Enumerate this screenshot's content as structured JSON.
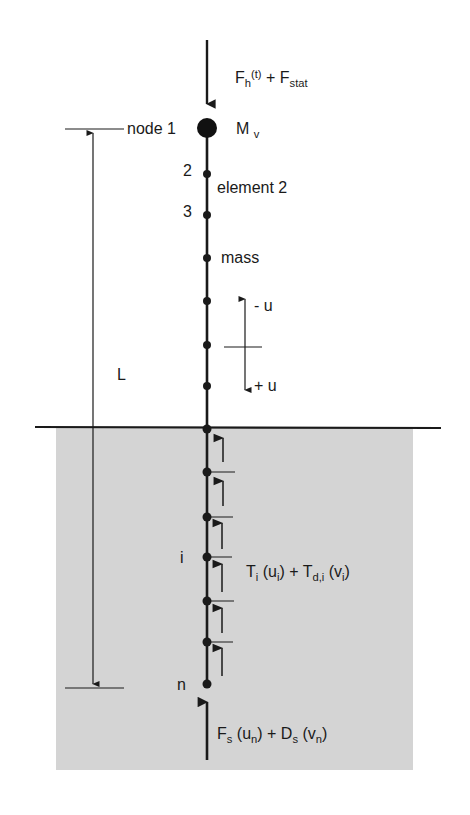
{
  "figure": {
    "type": "pile lumped-mass model diagram",
    "colors": {
      "soil": "#d4d4d4",
      "ink": "#1a1a1a",
      "background": "#ffffff"
    },
    "top_load": {
      "F": "F",
      "F_sub": "h",
      "t": "(t)",
      "plus": " + F",
      "stat": "stat"
    },
    "top_mass": {
      "M": "M",
      "M_sub": "v"
    },
    "node_labels": {
      "node1": "node 1",
      "node2": "2",
      "node3": "3",
      "node_i": "i",
      "node_n": "n"
    },
    "element_label": "element 2",
    "mass_label": "mass",
    "length_label": "L",
    "displacement": {
      "neg": "- u",
      "pos": "+ u"
    },
    "shaft_resistance": {
      "T": "T",
      "T_sub": "i",
      "u": " (u",
      "u_sub": "i",
      "mid": ") + T",
      "Td_sub": "d,i",
      "v": " (v",
      "v_sub": "i",
      "close": ")"
    },
    "toe_resistance": {
      "F": "F",
      "F_sub": "s",
      "u": " (u",
      "u_sub": "n",
      "mid": ") + D",
      "D_sub": "s",
      "v": " (v",
      "v_sub": "n",
      "close": ")"
    },
    "nodes_above_ground_y": [
      128,
      174,
      215,
      258,
      301,
      345,
      386
    ],
    "nodes_below_ground_y": [
      429,
      472,
      517,
      557,
      601,
      642,
      684
    ]
  }
}
